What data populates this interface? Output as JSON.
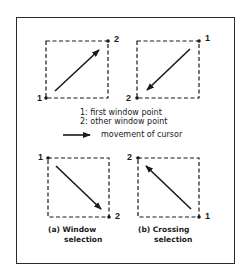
{
  "diagram": {
    "panels": [
      {
        "id": "top-left",
        "start_label": "1",
        "end_label": "2",
        "direction": "bottom-left to top-right"
      },
      {
        "id": "top-right",
        "start_label": "1",
        "end_label": "2",
        "direction": "top-right to bottom-left"
      },
      {
        "id": "bottom-left",
        "start_label": "1",
        "end_label": "2",
        "direction": "top-left to bottom-right",
        "caption_line1": "(a) Window",
        "caption_line2": "selection"
      },
      {
        "id": "bottom-right",
        "start_label": "1",
        "end_label": "2",
        "direction": "bottom-right to top-left",
        "caption_line1": "(b) Crossing",
        "caption_line2": "selection"
      }
    ],
    "legend": {
      "line1": "1: first window point",
      "line2": "2: other window point",
      "arrow_text": "movement of cursor"
    },
    "colors": {
      "ink": "#1a1a1a",
      "background": "#ffffff"
    }
  }
}
